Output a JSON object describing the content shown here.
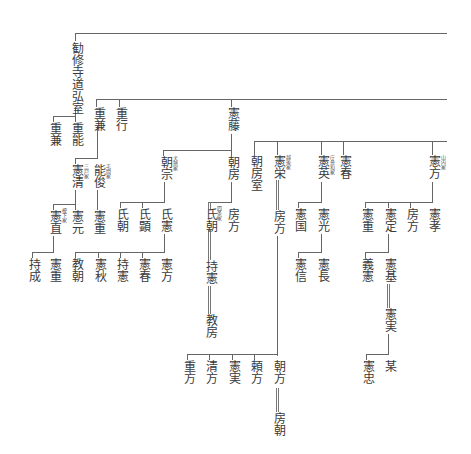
{
  "diagram": {
    "type": "genealogy-tree",
    "orientation": "vertical-japanese",
    "root": {
      "name": "勧修寺道弘室"
    },
    "nodes": {
      "kanshuji": "勧修寺道弘室",
      "shigekane_a": "重兼",
      "shigeyoshi": "重能",
      "shigekane_b": "重兼",
      "shigeyuki": "重行",
      "norifuji": "憲藤",
      "norikiyo": "憲清",
      "norikiyo_note": "三戸家",
      "yoshitoshi": "能俊",
      "yoshitoshi_note": "宅間家",
      "tomomune": "朝宗",
      "tomomune_note": "犬懸家",
      "tomofusa": "朝房",
      "tomofusa_shitsu": "朝房室",
      "norihide": "憲栄",
      "norihide_note": "越後家",
      "norifusa": "憲英",
      "norifusa_note": "庁鼻和家",
      "noriharu": "憲春",
      "norikata": "憲方",
      "norikata_note": "山内家",
      "noritada": "憲直",
      "noritada_note": "榎下家",
      "norimoto": "憲元",
      "norishige_a": "憲重",
      "ujitomo_a": "氏朝",
      "ujiaki": "氏顕",
      "ujinori": "氏憲",
      "ujitomo_b": "氏朝",
      "ujitomo_b_note": "四条家",
      "fusakata_a": "房方",
      "fusakata_b": "房方",
      "norikuni": "憲国",
      "norimitsu": "憲光",
      "norishige_b": "憲重",
      "norisada": "憲定",
      "fusakata_c": "房方",
      "noritaka": "憲孝",
      "mochinari": "持成",
      "norishige_c": "憲重",
      "noritomo": "教朝",
      "noriaki": "憲秋",
      "mochinori_a": "持憲",
      "noriharu_b": "憲春",
      "norikata_b": "憲方",
      "mochinori_b": "持憲",
      "norifusa_b": "教房",
      "norinobu": "憲信",
      "norinaga": "憲長",
      "yoshinori": "義憲",
      "norimoto_b": "憲基",
      "norizane_a": "憲実",
      "noritada_b": "憲忠",
      "bou": "某",
      "shigekata": "重方",
      "kiyokata": "清方",
      "norizane_b": "憲実",
      "yorikata": "頼方",
      "tomokata": "朝方",
      "fusatomo": "房朝"
    }
  }
}
